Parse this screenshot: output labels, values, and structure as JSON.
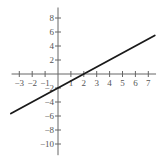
{
  "chart_data": {
    "type": "line",
    "title": "",
    "xlabel": "",
    "ylabel": "",
    "xlim": [
      -3.6,
      7.6
    ],
    "ylim": [
      -11.6,
      9.5
    ],
    "grid": false,
    "legend": null,
    "x_ticks": [
      -3,
      -2,
      -1,
      1,
      2,
      3,
      4,
      5,
      6,
      7
    ],
    "x_tick_labels": [
      "−3",
      "−2",
      "−1",
      "1",
      "2",
      "3",
      "4",
      "5",
      "6",
      "7"
    ],
    "y_ticks": [
      8,
      6,
      4,
      2,
      -2,
      -4,
      -6,
      -8,
      -10
    ],
    "y_tick_labels": [
      "8",
      "6",
      "4",
      "2",
      "−2",
      "−4",
      "−6",
      "−8",
      "−10"
    ],
    "series": [
      {
        "name": "y = x - 2",
        "equation": "y = x - 2",
        "slope": 1,
        "intercept": -2,
        "x": [
          -3.65,
          7.5
        ],
        "y": [
          -5.65,
          5.5
        ]
      }
    ]
  },
  "style": {
    "axis_color": "#666666",
    "line_color": "#1a1a1a",
    "label_color": "#555555"
  }
}
